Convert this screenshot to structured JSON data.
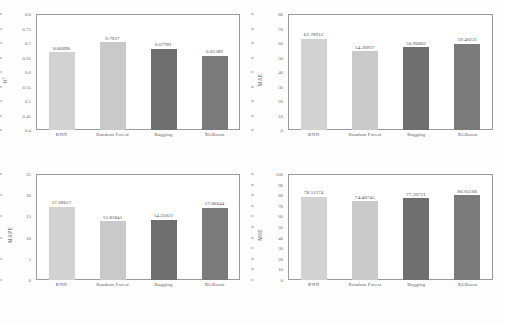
{
  "figure": {
    "background": "#fdfdfd",
    "caption": "",
    "categories": [
      "KNN",
      "Random Forest",
      "Bagging",
      "XGBoost"
    ],
    "bar_colors": [
      "#d2d2d2",
      "#c9c9c9",
      "#6e6e6e",
      "#7a7a7a"
    ]
  },
  "chart_data": [
    {
      "type": "bar",
      "panel": "top-left",
      "title": "",
      "xlabel": "",
      "ylabel": "R²",
      "ylabel_plain": "R2",
      "categories": [
        "KNN",
        "Random Forest",
        "Bagging",
        "XGBoost"
      ],
      "values": [
        0.66898,
        0.7027,
        0.67991,
        0.65589
      ],
      "value_labels": [
        "0.66898",
        "0.7027",
        "0.67991",
        "0.65589"
      ],
      "ylim": [
        0.4,
        0.8
      ],
      "yticks": [
        0.4,
        0.45,
        0.5,
        0.55,
        0.6,
        0.65,
        0.7,
        0.75,
        0.8
      ],
      "ytick_labels": [
        "0.4",
        "0.45",
        "0.5",
        "0.55",
        "0.6",
        "0.65",
        "0.7",
        "0.75",
        "0.8"
      ],
      "grid": false,
      "legend": "none",
      "colors": [
        "#d2d2d2",
        "#c9c9c9",
        "#6e6e6e",
        "#7a7a7a"
      ]
    },
    {
      "type": "bar",
      "panel": "top-right",
      "title": "",
      "xlabel": "",
      "ylabel": "MAE",
      "ylabel_plain": "MAE",
      "categories": [
        "KNN",
        "Random Forest",
        "Bagging",
        "XGBoost"
      ],
      "values": [
        62.78912,
        54.30937,
        56.96863,
        59.40231
      ],
      "value_labels": [
        "62.78912",
        "54.30937",
        "56.96863",
        "59.40231"
      ],
      "ylim": [
        0,
        80
      ],
      "yticks": [
        0,
        10,
        20,
        30,
        40,
        50,
        60,
        70,
        80
      ],
      "ytick_labels": [
        "0",
        "10",
        "20",
        "30",
        "40",
        "50",
        "60",
        "70",
        "80"
      ],
      "grid": false,
      "legend": "none",
      "colors": [
        "#d2d2d2",
        "#c9c9c9",
        "#6e6e6e",
        "#7a7a7a"
      ]
    },
    {
      "type": "bar",
      "panel": "bottom-left",
      "title": "",
      "xlabel": "",
      "ylabel": "MAPE",
      "ylabel_plain": "MAPE",
      "categories": [
        "KNN",
        "Random Forest",
        "Bagging",
        "XGBoost"
      ],
      "values": [
        17.28657,
        13.85841,
        14.23021,
        17.06644
      ],
      "value_labels": [
        "17.28657",
        "13.85841",
        "14.23021",
        "17.06644"
      ],
      "ylim": [
        0,
        25
      ],
      "yticks": [
        0,
        5,
        10,
        15,
        20,
        25
      ],
      "ytick_labels": [
        "0",
        "5",
        "10",
        "15",
        "20",
        "25"
      ],
      "grid": false,
      "legend": "none",
      "colors": [
        "#d2d2d2",
        "#c9c9c9",
        "#6e6e6e",
        "#7a7a7a"
      ]
    },
    {
      "type": "bar",
      "panel": "bottom-right",
      "title": "",
      "xlabel": "",
      "ylabel": "MSE",
      "ylabel_plain": "MSE",
      "categories": [
        "KNN",
        "Random Forest",
        "Bagging",
        "XGBoost"
      ],
      "values": [
        78.51374,
        74.40745,
        77.20721,
        80.05106
      ],
      "value_labels": [
        "78.51374",
        "74.40745",
        "77.20721",
        "80.05106"
      ],
      "ylim": [
        0,
        100
      ],
      "yticks": [
        0,
        10,
        20,
        30,
        40,
        50,
        60,
        70,
        80,
        90,
        100
      ],
      "ytick_labels": [
        "0",
        "10",
        "20",
        "30",
        "40",
        "50",
        "60",
        "70",
        "80",
        "90",
        "100"
      ],
      "grid": false,
      "legend": "none",
      "colors": [
        "#d2d2d2",
        "#c9c9c9",
        "#6e6e6e",
        "#7a7a7a"
      ]
    }
  ]
}
